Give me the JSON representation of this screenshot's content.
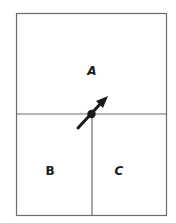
{
  "diagram": {
    "regions": [
      {
        "id": "A",
        "label": "A"
      },
      {
        "id": "B",
        "label": "B"
      },
      {
        "id": "C",
        "label": "C"
      }
    ],
    "colors": {
      "border": "#6b6b6b",
      "arrow": "#1a1a1a",
      "background": "#ffffff"
    },
    "arrow": {
      "direction": "up-right",
      "origin": "junction-point"
    }
  }
}
